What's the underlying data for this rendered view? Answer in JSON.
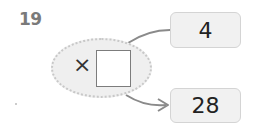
{
  "problem": {
    "number": "19",
    "operator": "×",
    "blank": "",
    "input_value": "4",
    "output_value": "28"
  },
  "icons": {
    "arrow": "arrow-right-icon"
  },
  "colors": {
    "ellipse_fill": "#efefef",
    "box_fill": "#f1f1f1",
    "line": "#8a8a8a",
    "number": "#7a7a7a"
  }
}
